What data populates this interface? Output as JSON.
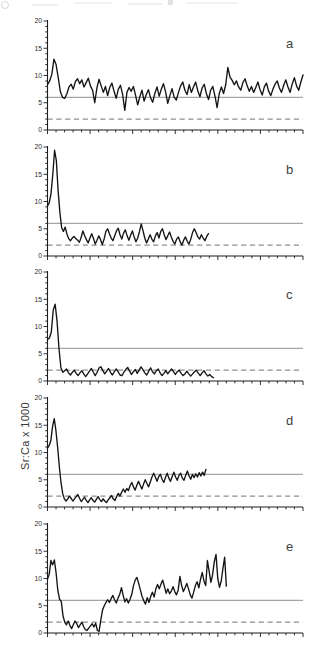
{
  "figure": {
    "ylabel": "Sr:Ca x 1000",
    "panel_letters": [
      "a",
      "b",
      "c",
      "d",
      "e"
    ]
  },
  "chart_data": {
    "type": "line",
    "title": "",
    "xlabel": "",
    "ylabel": "Sr:Ca x 1000",
    "ylim": [
      0,
      20
    ],
    "yticks": [
      0,
      5,
      10,
      15,
      20
    ],
    "y_minor_tick_step": 1,
    "x_axis": {
      "tick_intervals": 30,
      "major_every": 5,
      "tick_labels": []
    },
    "grid": false,
    "legend": "none",
    "reference_lines": {
      "solid_y": 6,
      "dashed_y": 2
    },
    "colors": {
      "data_line": "#141414",
      "reference_line": "#8f8f8f",
      "axis": "#1c1c1c",
      "tick_label": "#2a2a2a",
      "panel_label": "#3f3f3f"
    },
    "panels": [
      {
        "label": "a",
        "x_end": 1.0,
        "values": [
          8.3,
          9.0,
          10.2,
          13.0,
          12.0,
          9.6,
          7.0,
          6.0,
          5.8,
          6.6,
          7.9,
          8.4,
          7.5,
          8.9,
          9.4,
          8.5,
          9.2,
          7.9,
          8.7,
          9.5,
          8.1,
          7.3,
          5.0,
          7.7,
          9.3,
          8.1,
          6.9,
          8.0,
          6.3,
          7.8,
          8.6,
          7.1,
          5.8,
          7.5,
          8.2,
          6.5,
          3.6,
          6.9,
          7.8,
          7.1,
          8.0,
          6.4,
          4.6,
          6.1,
          7.3,
          5.3,
          6.5,
          7.4,
          5.9,
          5.1,
          6.7,
          7.9,
          6.2,
          7.5,
          8.5,
          7.0,
          4.9,
          6.3,
          7.6,
          6.0,
          5.5,
          6.9,
          8.1,
          8.8,
          7.3,
          6.5,
          8.3,
          6.9,
          7.9,
          8.8,
          7.2,
          6.1,
          7.7,
          8.4,
          6.7,
          5.6,
          7.3,
          8.0,
          6.2,
          4.1,
          6.7,
          7.9,
          6.7,
          8.3,
          11.5,
          9.7,
          9.1,
          8.3,
          9.0,
          7.9,
          7.3,
          8.7,
          9.4,
          8.1,
          7.1,
          8.0,
          6.9,
          7.8,
          8.8,
          7.4,
          6.4,
          7.9,
          8.6,
          7.1,
          6.3,
          7.5,
          8.4,
          9.0,
          7.7,
          6.9,
          8.2,
          9.2,
          7.9,
          6.9,
          8.5,
          9.6,
          8.1,
          7.3,
          8.8,
          10.1
        ]
      },
      {
        "label": "b",
        "x_end": 0.63,
        "values": [
          9.2,
          9.8,
          11.5,
          15.0,
          19.4,
          17.5,
          12.0,
          8.0,
          5.2,
          4.5,
          5.3,
          4.0,
          3.2,
          2.8,
          3.3,
          3.6,
          3.2,
          2.9,
          2.5,
          3.4,
          4.6,
          3.7,
          3.0,
          2.4,
          3.3,
          4.1,
          3.2,
          2.2,
          2.9,
          3.7,
          3.0,
          2.1,
          3.1,
          4.5,
          5.0,
          4.1,
          3.3,
          2.8,
          3.7,
          4.6,
          5.1,
          3.9,
          3.1,
          4.2,
          4.8,
          3.7,
          2.9,
          3.8,
          4.6,
          3.5,
          2.6,
          3.3,
          4.5,
          5.9,
          4.6,
          3.3,
          2.4,
          3.1,
          3.9,
          3.1,
          2.6,
          3.7,
          4.3,
          3.3,
          4.5,
          5.0,
          3.9,
          3.0,
          3.7,
          4.4,
          3.5,
          2.7,
          2.2,
          3.1,
          3.5,
          2.6,
          2.0,
          2.9,
          3.5,
          2.7,
          2.2,
          3.1,
          4.3,
          5.0,
          4.3,
          3.5,
          3.1,
          3.9,
          3.3,
          2.8,
          3.6,
          4.1
        ]
      },
      {
        "label": "c",
        "x_end": 0.65,
        "values": [
          7.6,
          7.9,
          9.0,
          13.0,
          14.1,
          11.0,
          6.0,
          2.5,
          1.6,
          1.9,
          2.2,
          1.5,
          1.1,
          1.6,
          2.0,
          1.4,
          1.0,
          1.5,
          1.9,
          1.3,
          0.8,
          1.3,
          1.8,
          2.3,
          1.6,
          1.0,
          1.6,
          2.4,
          2.6,
          1.9,
          1.3,
          1.8,
          2.3,
          1.6,
          1.1,
          1.7,
          2.2,
          1.7,
          1.1,
          1.0,
          1.6,
          2.1,
          2.5,
          1.8,
          1.2,
          1.7,
          2.1,
          1.4,
          2.0,
          2.6,
          2.1,
          1.5,
          1.1,
          1.8,
          2.4,
          1.7,
          1.3,
          1.9,
          2.2,
          1.5,
          1.0,
          1.4,
          1.9,
          1.3,
          1.8,
          2.2,
          1.7,
          1.2,
          1.7,
          2.0,
          1.4,
          1.0,
          1.3,
          1.8,
          1.3,
          0.9,
          1.3,
          1.7,
          2.0,
          1.4,
          1.0,
          1.5,
          1.9,
          1.3,
          0.9,
          1.2,
          0.8,
          0.6
        ]
      },
      {
        "label": "d",
        "x_end": 0.62,
        "values": [
          10.8,
          11.3,
          12.2,
          14.8,
          16.2,
          14.0,
          11.0,
          7.5,
          4.5,
          2.5,
          1.5,
          1.1,
          1.5,
          2.0,
          1.6,
          1.1,
          1.5,
          1.9,
          2.3,
          1.6,
          1.0,
          1.4,
          1.8,
          1.2,
          0.8,
          1.3,
          1.7,
          1.2,
          0.9,
          1.4,
          1.9,
          1.4,
          1.0,
          1.5,
          1.1,
          0.8,
          1.3,
          1.7,
          2.1,
          1.5,
          1.2,
          1.9,
          2.5,
          2.0,
          2.7,
          3.3,
          2.7,
          3.4,
          3.0,
          3.9,
          4.5,
          3.7,
          3.1,
          4.0,
          4.7,
          4.0,
          3.3,
          4.2,
          5.0,
          4.3,
          3.7,
          4.6,
          5.5,
          6.2,
          5.5,
          4.7,
          5.6,
          6.0,
          5.1,
          4.5,
          5.4,
          6.2,
          5.3,
          4.7,
          5.6,
          6.4,
          5.5,
          4.9,
          5.8,
          6.2,
          5.3,
          4.9,
          5.8,
          6.6,
          5.7,
          5.1,
          6.0,
          5.4,
          6.1,
          5.5,
          6.3,
          5.7,
          6.4,
          5.8,
          6.9
        ]
      },
      {
        "label": "e",
        "x_end": 0.7,
        "values": [
          9.9,
          10.8,
          13.3,
          12.5,
          13.4,
          11.0,
          7.8,
          6.2,
          5.8,
          3.2,
          2.0,
          1.5,
          2.2,
          1.4,
          0.8,
          1.5,
          2.2,
          1.7,
          1.0,
          1.5,
          2.0,
          1.2,
          0.6,
          0.5,
          0.9,
          1.3,
          1.7,
          1.1,
          1.8,
          0.5,
          0.3,
          2.4,
          4.2,
          5.0,
          5.6,
          6.1,
          5.6,
          6.3,
          6.9,
          6.1,
          5.5,
          6.4,
          7.1,
          8.3,
          6.9,
          5.7,
          6.3,
          5.5,
          6.2,
          7.1,
          8.7,
          9.7,
          10.2,
          9.1,
          7.9,
          6.7,
          5.9,
          5.3,
          6.5,
          5.6,
          6.7,
          7.5,
          6.6,
          8.1,
          8.9,
          8.1,
          9.0,
          9.7,
          8.5,
          7.3,
          8.1,
          7.2,
          7.7,
          8.5,
          7.6,
          7.0,
          7.9,
          10.4,
          8.7,
          7.6,
          8.3,
          9.1,
          8.1,
          7.0,
          6.4,
          7.5,
          8.7,
          9.4,
          8.3,
          9.9,
          11.1,
          9.5,
          8.7,
          13.3,
          11.3,
          9.3,
          10.7,
          13.1,
          14.4,
          10.0,
          8.4,
          9.5,
          11.8,
          13.9,
          8.6
        ]
      }
    ]
  }
}
